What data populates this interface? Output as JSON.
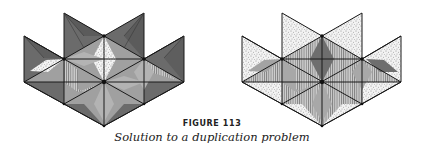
{
  "figure": {
    "number_label": "FIGURE 113",
    "caption": "Solution to a duplication problem"
  },
  "panels": [
    {
      "name": "left-tiling",
      "fills": {
        "outer_triangles": "dark-gray",
        "inner_rhombi": "mid-gray",
        "center_top_rhombus": "stipple",
        "left_rhombus": "stipple",
        "accents": "vertical-hatch"
      }
    },
    {
      "name": "right-tiling",
      "fills": {
        "outer_triangles": "stipple",
        "inner_rhombi": "vertical-hatch/mid-gray",
        "center_top_rhombus": "dark-gray",
        "right_rhombus": "dark-gray"
      }
    }
  ],
  "colors": {
    "dark": "#6e6e6e",
    "mid": "#a3a3a3",
    "light": "#c9c9c9",
    "line": "#1a1a1a",
    "paper": "#ffffff"
  }
}
